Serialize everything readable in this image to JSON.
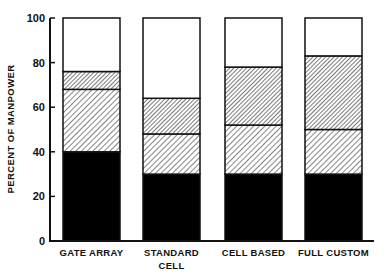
{
  "chart_data": {
    "type": "bar",
    "stacked": true,
    "title": "",
    "xlabel": "",
    "ylabel": "PERCENT OF MANPOWER",
    "ylim": [
      0,
      100
    ],
    "yticks": [
      0,
      20,
      40,
      60,
      80,
      100
    ],
    "grid": false,
    "legend": null,
    "categories": [
      "GATE ARRAY",
      "STANDARD CELL",
      "CELL BASED",
      "FULL CUSTOM"
    ],
    "category_lines": [
      [
        "GATE ARRAY"
      ],
      [
        "STANDARD",
        "CELL"
      ],
      [
        "CELL BASED"
      ],
      [
        "FULL CUSTOM"
      ]
    ],
    "series": [
      {
        "name": "segment-1 (solid black)",
        "pattern": "solid",
        "color": "#000000",
        "values": [
          40,
          30,
          30,
          30
        ]
      },
      {
        "name": "segment-2 (light diagonal hatch)",
        "pattern": "hatch-light",
        "color": "#555555",
        "values": [
          28,
          18,
          22,
          20
        ]
      },
      {
        "name": "segment-3 (dense diagonal hatch)",
        "pattern": "hatch-dense",
        "color": "#333333",
        "values": [
          8,
          16,
          26,
          33
        ]
      },
      {
        "name": "segment-4 (white)",
        "pattern": "none",
        "color": "#ffffff",
        "values": [
          24,
          36,
          22,
          17
        ]
      }
    ],
    "cumulative_tops": [
      [
        40,
        68,
        76,
        100
      ],
      [
        30,
        48,
        64,
        100
      ],
      [
        30,
        52,
        78,
        100
      ],
      [
        30,
        50,
        83,
        100
      ]
    ]
  }
}
